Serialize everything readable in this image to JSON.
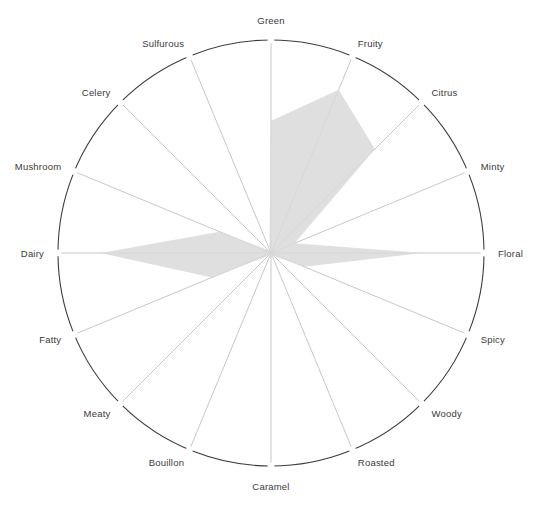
{
  "chart_data": {
    "type": "radar",
    "title": "",
    "subtitle": "",
    "xlabel": "",
    "ylabel": "",
    "grid": false,
    "legend_position": "none",
    "rlim": [
      0,
      1
    ],
    "axis_start_angle_deg": 90,
    "axis_direction": "clockwise",
    "categories": [
      "Green",
      "Fruity",
      "Citrus",
      "Minty",
      "Floral",
      "Spicy",
      "Woody",
      "Roasted",
      "Caramel",
      "Bouillon",
      "Meaty",
      "Fatty",
      "Dairy",
      "Mushroom",
      "Celery",
      "Sulfurous"
    ],
    "series": [
      {
        "name": "Flavor profile",
        "color": "#d9d9d9",
        "values": [
          0.62,
          0.83,
          0.69,
          0.12,
          0.71,
          0.17,
          0.02,
          0.02,
          0.02,
          0.02,
          0.02,
          0.3,
          0.8,
          0.26,
          0.02,
          0.02
        ]
      }
    ]
  },
  "chart": {
    "center_x": 271,
    "center_y": 253,
    "radius": 213,
    "ring_color": "#3c3c3c",
    "spoke_color": "#b9b9b9",
    "fill_color": "#d9d9d9",
    "label_color": "#3a3a3a",
    "background_color": "#ffffff"
  }
}
